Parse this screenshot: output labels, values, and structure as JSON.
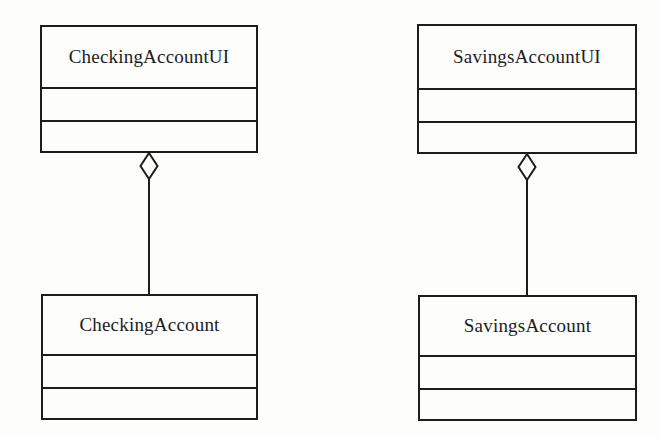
{
  "diagram": {
    "kind": "uml-class-diagram",
    "background_color": "#fdfdfc",
    "line_color": "#1c1c1c",
    "classes": [
      {
        "id": "checking-account-ui",
        "name": "CheckingAccountUI",
        "empty_compartments": 2
      },
      {
        "id": "savings-account-ui",
        "name": "SavingsAccountUI",
        "empty_compartments": 2
      },
      {
        "id": "checking-account",
        "name": "CheckingAccount",
        "empty_compartments": 2
      },
      {
        "id": "savings-account",
        "name": "SavingsAccount",
        "empty_compartments": 2
      }
    ],
    "relationships": [
      {
        "type": "aggregation",
        "diamond_style": "hollow",
        "whole": "CheckingAccountUI",
        "part": "CheckingAccount",
        "diamond_at": "CheckingAccountUI"
      },
      {
        "type": "aggregation",
        "diamond_style": "hollow",
        "whole": "SavingsAccountUI",
        "part": "SavingsAccount",
        "diamond_at": "SavingsAccountUI"
      }
    ]
  }
}
